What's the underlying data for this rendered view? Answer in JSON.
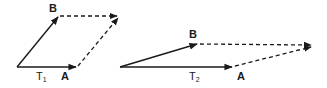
{
  "diagram": {
    "type": "vector-parallelogram",
    "colors": {
      "stroke": "#1a1a1a",
      "background": "#ffffff"
    },
    "figures": [
      {
        "id": "T1",
        "label_main": "T",
        "label_sub": "1",
        "vertex_labels": {
          "a": "A",
          "b": "B"
        },
        "vectors": [
          "origin→A (solid)",
          "origin→B (solid)",
          "A→resultant (dashed)",
          "B→resultant (dashed)"
        ]
      },
      {
        "id": "T2",
        "label_main": "T",
        "label_sub": "2",
        "vertex_labels": {
          "a": "A",
          "b": "B"
        },
        "vectors": [
          "origin→A (solid)",
          "origin→B (solid)",
          "A→resultant (dashed)",
          "B→resultant (dashed)"
        ]
      }
    ]
  }
}
